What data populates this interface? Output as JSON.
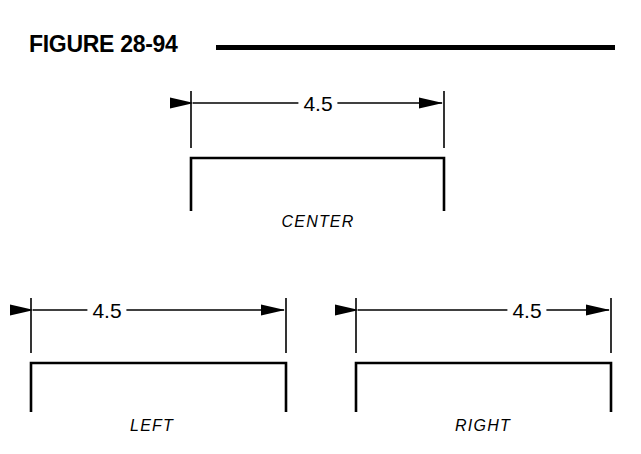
{
  "figure": {
    "title": "FIGURE 28-94",
    "rule_color": "#000000",
    "line_color": "#000000",
    "background": "#ffffff"
  },
  "views": [
    {
      "id": "center",
      "label": "CENTER",
      "dimension_value": "4.5",
      "justification": "center",
      "extension_left_x": 191,
      "extension_right_x": 444,
      "dim_line_y": 103,
      "text_center_x": 318,
      "profile_top_y": 158,
      "profile_bottom_y": 211,
      "label_x": 318,
      "label_y": 213
    },
    {
      "id": "left",
      "label": "LEFT",
      "dimension_value": "4.5",
      "justification": "left",
      "extension_left_x": 31,
      "extension_right_x": 286,
      "dim_line_y": 310,
      "text_center_x": 107,
      "profile_top_y": 363,
      "profile_bottom_y": 412,
      "label_x": 152,
      "label_y": 417
    },
    {
      "id": "right",
      "label": "RIGHT",
      "dimension_value": "4.5",
      "justification": "right",
      "extension_left_x": 356,
      "extension_right_x": 611,
      "dim_line_y": 310,
      "text_center_x": 527,
      "profile_top_y": 363,
      "profile_bottom_y": 412,
      "label_x": 483,
      "label_y": 417
    }
  ]
}
